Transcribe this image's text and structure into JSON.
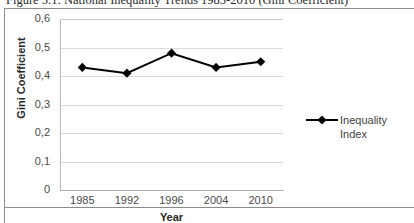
{
  "caption": "Figure 5.1: National Inequality Trends 1985-2010 (Gini Coefficient)",
  "chart_data": {
    "type": "line",
    "title": "",
    "xlabel": "Year",
    "ylabel": "Gini Coefficient",
    "categories": [
      "1985",
      "1992",
      "1996",
      "2004",
      "2010"
    ],
    "series": [
      {
        "name": "Inequality Index",
        "values": [
          0.43,
          0.41,
          0.48,
          0.43,
          0.45
        ],
        "color": "#000000",
        "marker": "diamond"
      }
    ],
    "ylim": [
      0,
      0.6
    ],
    "ytick_labels": [
      "0,6",
      "0,5",
      "0,4",
      "0,3",
      "0,2",
      "0,1",
      "0"
    ],
    "ytick_values": [
      0.6,
      0.5,
      0.4,
      0.3,
      0.2,
      0.1,
      0
    ],
    "grid": "horizontal",
    "legend_position": "right",
    "legend_entries": [
      "Inequality",
      "Index"
    ]
  }
}
